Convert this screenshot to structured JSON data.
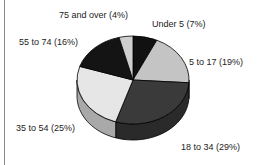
{
  "chart_data": {
    "type": "pie",
    "style": "3d",
    "title": "",
    "categories": [
      "Under 5",
      "5 to 17",
      "18 to 34",
      "35 to 54",
      "55 to 74",
      "75 and over"
    ],
    "values": [
      7,
      19,
      29,
      25,
      16,
      4
    ],
    "unit": "%",
    "labels": [
      "Under 5  (7%)",
      "5 to 17 (19%)",
      "18 to 34 (29%)",
      "35 to 54 (25%)",
      "55 to 74 (16%)",
      "75 and over (4%)"
    ],
    "colors": [
      "#111111",
      "#c4c4c4",
      "#3a3a3a",
      "#e6e6e6",
      "#141414",
      "#cfcfcf"
    ],
    "side_colors": [
      "#0a0a0a",
      "#9a9a9a",
      "#2a2a2a",
      "#a9a9a9",
      "#0a0a0a",
      "#9f9f9f"
    ],
    "legend": "none",
    "grid": false
  }
}
